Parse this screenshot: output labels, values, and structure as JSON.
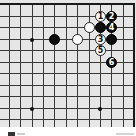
{
  "diagram": {
    "type": "go-board-corner",
    "corner": "top-right",
    "grid": {
      "columns_x": [
        9,
        20,
        32,
        43,
        54,
        66,
        77,
        89,
        100,
        111,
        123,
        134
      ],
      "rows_y": [
        4,
        16,
        27,
        39,
        50,
        62,
        73,
        85,
        96,
        108,
        119
      ],
      "line_color": "#3a3a3a",
      "board_color": "#e6e6e6"
    },
    "star_points": [
      {
        "x": 32,
        "y": 39
      },
      {
        "x": 32,
        "y": 108
      },
      {
        "x": 100,
        "y": 108
      }
    ],
    "stones": [
      {
        "color": "black",
        "x": 54,
        "y": 39,
        "label": ""
      },
      {
        "color": "white",
        "x": 77,
        "y": 39,
        "label": ""
      },
      {
        "color": "white",
        "x": 89,
        "y": 27,
        "label": ""
      },
      {
        "color": "black",
        "x": 100,
        "y": 27,
        "label": ""
      },
      {
        "color": "black",
        "x": 111,
        "y": 39,
        "label": ""
      },
      {
        "color": "white",
        "x": 100,
        "y": 16,
        "label": "1"
      },
      {
        "color": "black",
        "x": 111,
        "y": 16,
        "label": "2"
      },
      {
        "color": "white",
        "x": 100,
        "y": 39,
        "label": "3"
      },
      {
        "color": "black",
        "x": 111,
        "y": 27,
        "label": "4"
      },
      {
        "color": "white",
        "x": 100,
        "y": 50,
        "label": "5"
      },
      {
        "color": "black",
        "x": 111,
        "y": 62,
        "label": "6"
      }
    ]
  },
  "caption": {
    "marker_icon": "black-square-icon"
  }
}
